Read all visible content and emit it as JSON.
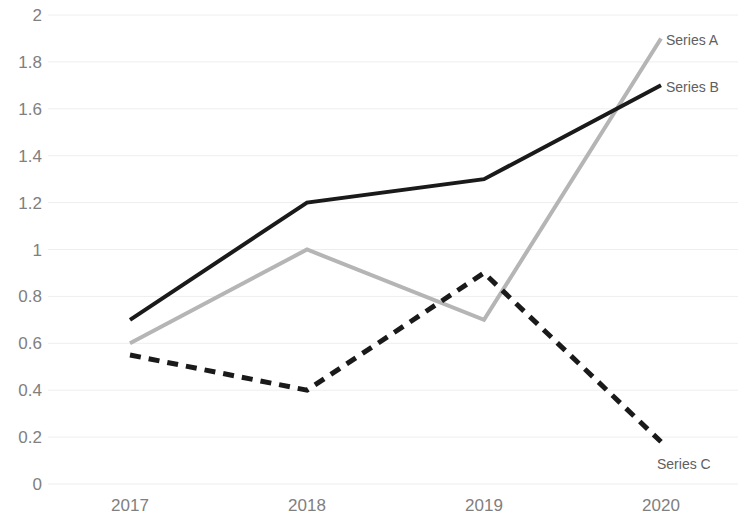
{
  "chart_data": {
    "type": "line",
    "title": "",
    "xlabel": "",
    "ylabel": "",
    "categories": [
      "2017",
      "2018",
      "2019",
      "2020"
    ],
    "ylim": [
      0,
      2
    ],
    "ytick_step": 0.2,
    "yticks": [
      "2",
      "1.8",
      "1.6",
      "1.4",
      "1.2",
      "1",
      "0.8",
      "0.6",
      "0.4",
      "0.2",
      "0"
    ],
    "grid": true,
    "legend_position": "inline-end-of-line",
    "series": [
      {
        "name": "Series A",
        "values": [
          0.6,
          1.0,
          0.7,
          1.9
        ],
        "color": "#b5b5b5",
        "style": "solid",
        "label_x": 666,
        "label_y": 33
      },
      {
        "name": "Series B",
        "values": [
          0.7,
          1.2,
          1.3,
          1.7
        ],
        "color": "#1a1a1a",
        "style": "solid",
        "label_x": 666,
        "label_y": 80
      },
      {
        "name": "Series C",
        "values": [
          0.55,
          0.4,
          0.9,
          0.18
        ],
        "color": "#1a1a1a",
        "style": "dashed",
        "label_x": 657,
        "label_y": 457
      }
    ],
    "axis_colors": {
      "tick_label": "#808080",
      "gridline": "#eeeeee",
      "legend_label": "#606060"
    }
  }
}
